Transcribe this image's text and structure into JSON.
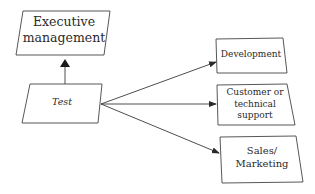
{
  "diagram": {
    "nodes": [
      {
        "id": "executive",
        "label": "Executive management"
      },
      {
        "id": "test",
        "label": "Test"
      },
      {
        "id": "development",
        "label": "Development"
      },
      {
        "id": "support",
        "label": "Customer or technical support"
      },
      {
        "id": "sales",
        "label": "Sales/ Marketing"
      }
    ],
    "edges": [
      {
        "from": "test",
        "to": "executive"
      },
      {
        "from": "test",
        "to": "development"
      },
      {
        "from": "test",
        "to": "support"
      },
      {
        "from": "test",
        "to": "sales"
      }
    ],
    "colors": {
      "line": "#3a3a3a",
      "background": "#ffffff"
    }
  }
}
